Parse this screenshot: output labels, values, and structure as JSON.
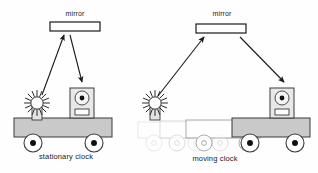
{
  "figure": {
    "background": "#fefefe",
    "ink": "#1a1a1a",
    "cart_fill": "#c9c9c9",
    "cart_stroke": "#3a3a3a",
    "ghost_stroke": "#bdbdbd",
    "ghost_mid_stroke": "#8d8d8d"
  },
  "panels": [
    {
      "id": "stationary",
      "caption": "stationary clock",
      "caption_x": 66,
      "caption_y": 152,
      "mirror": {
        "label": "mirror",
        "label_x": 75,
        "label_y": 10,
        "x": 50,
        "y": 22,
        "w": 50,
        "h": 9
      },
      "light_source": {
        "name": "light-source",
        "cx": 37,
        "cy": 103
      },
      "detector": {
        "name": "detector",
        "x": 70,
        "y": 88,
        "w": 24,
        "h": 30
      },
      "cart": {
        "x": 14,
        "y": 118,
        "w": 98,
        "h": 19
      },
      "wheels": [
        {
          "cx": 33,
          "cy": 143,
          "r": 9
        },
        {
          "cx": 94,
          "cy": 143,
          "r": 9
        }
      ],
      "beam_up": {
        "x1": 42,
        "y1": 95,
        "x2": 64,
        "y2": 35
      },
      "beam_down": {
        "x1": 70,
        "y1": 35,
        "x2": 82,
        "y2": 82
      },
      "ghosts": []
    },
    {
      "id": "moving",
      "caption": "moving clock",
      "caption_x": 215,
      "caption_y": 154,
      "mirror": {
        "label": "mirror",
        "label_x": 222,
        "label_y": 10,
        "x": 196,
        "y": 24,
        "w": 50,
        "h": 9
      },
      "light_source": {
        "name": "light-source",
        "cx": 155,
        "cy": 103
      },
      "detector": {
        "name": "detector",
        "x": 270,
        "y": 88,
        "w": 24,
        "h": 30
      },
      "cart": {
        "x": 232,
        "y": 118,
        "w": 78,
        "h": 19
      },
      "wheels": [
        {
          "cx": 250,
          "cy": 143,
          "r": 9
        },
        {
          "cx": 295,
          "cy": 143,
          "r": 9
        }
      ],
      "beam_up": {
        "x1": 158,
        "y1": 96,
        "x2": 204,
        "y2": 37
      },
      "beam_down": {
        "x1": 240,
        "y1": 37,
        "x2": 284,
        "y2": 82
      },
      "ghosts": [
        {
          "x": 138,
          "y": 122,
          "w": 70,
          "h": 16,
          "wheels": [
            {
              "cx": 154,
              "cy": 143,
              "r": 8
            },
            {
              "cx": 196,
              "cy": 143,
              "r": 8
            }
          ],
          "opacity": 0.35
        },
        {
          "x": 160,
          "y": 121,
          "w": 72,
          "h": 17,
          "wheels": [
            {
              "cx": 177,
              "cy": 143,
              "r": 8
            },
            {
              "cx": 220,
              "cy": 143,
              "r": 8
            }
          ],
          "opacity": 0.55
        },
        {
          "x": 186,
          "y": 120,
          "w": 74,
          "h": 18,
          "wheels": [
            {
              "cx": 204,
              "cy": 143,
              "r": 8
            },
            {
              "cx": 247,
              "cy": 143,
              "r": 8
            }
          ],
          "opacity": 0.8
        }
      ]
    }
  ]
}
